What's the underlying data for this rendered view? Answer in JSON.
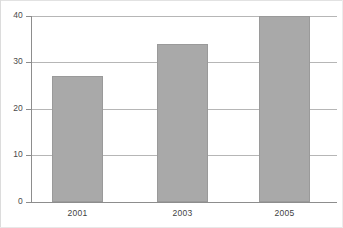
{
  "chart_data": {
    "type": "bar",
    "title": "",
    "xlabel": "",
    "ylabel": "",
    "categories": [
      "2001",
      "2003",
      "2005"
    ],
    "values": [
      27,
      34,
      40
    ],
    "ylim": [
      0,
      40
    ],
    "yticks": [
      "0",
      "10",
      "20",
      "30",
      "40"
    ],
    "ytick_values": [
      0,
      10,
      20,
      30,
      40
    ],
    "grid": "horizontal",
    "legend": "none",
    "series": [
      {
        "name": "",
        "values": [
          27,
          34,
          40
        ]
      }
    ]
  },
  "style": {
    "bar_fill": "#a9a9a9",
    "bar_stroke": "#9a9a9a",
    "gridline_color": "#b6b6b6",
    "axis_color": "#8d8d8d",
    "tick_label_color": "#4a4a4a",
    "background": "#ffffff"
  }
}
